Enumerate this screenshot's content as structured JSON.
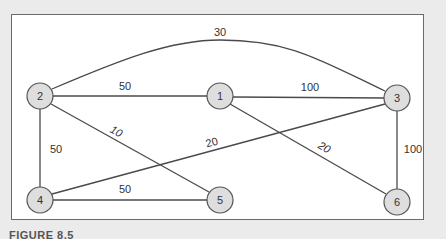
{
  "figure": {
    "caption": "FIGURE 8.5",
    "colors": {
      "background": "#ebebeb",
      "frame": "#ffffff",
      "node_fill": "#dedede",
      "stroke": "#4a4a4a"
    }
  },
  "graph": {
    "nodes": [
      {
        "id": "1",
        "label": "1",
        "x": 220,
        "y": 96
      },
      {
        "id": "2",
        "label": "2",
        "x": 40,
        "y": 96
      },
      {
        "id": "3",
        "label": "3",
        "x": 397,
        "y": 98
      },
      {
        "id": "4",
        "label": "4",
        "x": 40,
        "y": 200
      },
      {
        "id": "5",
        "label": "5",
        "x": 220,
        "y": 200
      },
      {
        "id": "6",
        "label": "6",
        "x": 397,
        "y": 202
      }
    ],
    "edges": [
      {
        "from": "2",
        "to": "3",
        "weight": "30",
        "curved": true
      },
      {
        "from": "2",
        "to": "1",
        "weight": "50"
      },
      {
        "from": "1",
        "to": "3",
        "weight": "100"
      },
      {
        "from": "2",
        "to": "5",
        "weight": "10"
      },
      {
        "from": "2",
        "to": "4",
        "weight": "50"
      },
      {
        "from": "4",
        "to": "3",
        "weight": "20"
      },
      {
        "from": "1",
        "to": "6",
        "weight": "20"
      },
      {
        "from": "3",
        "to": "6",
        "weight": "100"
      },
      {
        "from": "4",
        "to": "5",
        "weight": "50"
      }
    ]
  }
}
